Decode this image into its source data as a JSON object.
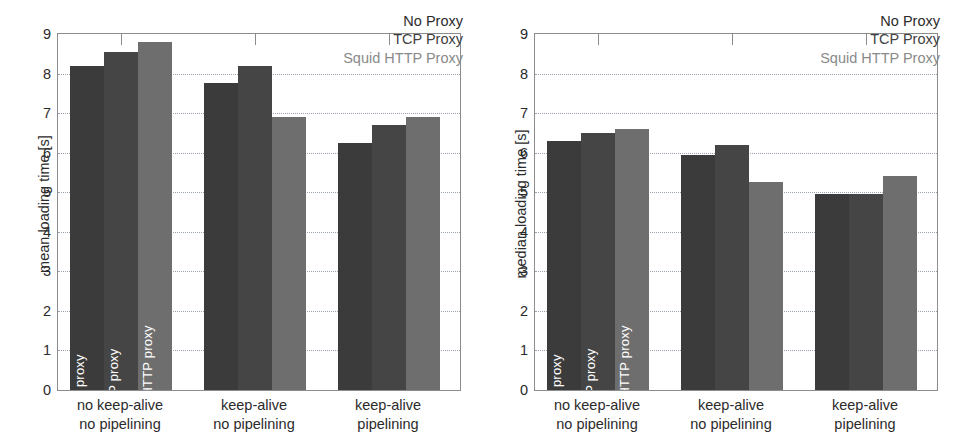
{
  "chart_data": [
    {
      "type": "bar",
      "title": "",
      "panel": "left",
      "xlabel": "",
      "ylabel": "mean loading time [s]",
      "ylim": [
        0,
        9
      ],
      "yticks": [
        0,
        1,
        2,
        3,
        4,
        5,
        6,
        7,
        8,
        9
      ],
      "ytick_labels": [
        "0",
        "1",
        "2",
        "3",
        "4",
        "5",
        "6",
        "7",
        "8",
        "9"
      ],
      "grid": true,
      "legend_position": "top-right",
      "categories": [
        "no keep-alive\nno pipelining",
        "keep-alive\nno pipelining",
        "keep-alive\npipelining"
      ],
      "category_lines": [
        [
          "no keep-alive",
          "no pipelining"
        ],
        [
          "keep-alive",
          "no pipelining"
        ],
        [
          "keep-alive",
          "pipelining"
        ]
      ],
      "series": [
        {
          "name": "No Proxy",
          "bar_label": "no proxy",
          "color": "#3b3b3b",
          "values": [
            8.2,
            7.75,
            6.25
          ]
        },
        {
          "name": "TCP Proxy",
          "bar_label": "TCP proxy",
          "color": "#454545",
          "values": [
            8.55,
            8.2,
            6.7
          ]
        },
        {
          "name": "Squid HTTP Proxy",
          "bar_label": "Squid HTTP proxy",
          "color": "#6e6e6e",
          "values": [
            8.8,
            6.9,
            6.9
          ]
        }
      ]
    },
    {
      "type": "bar",
      "title": "",
      "panel": "right",
      "xlabel": "",
      "ylabel": "median loading time [s]",
      "ylim": [
        0,
        9
      ],
      "yticks": [
        0,
        1,
        2,
        3,
        4,
        5,
        6,
        7,
        8,
        9
      ],
      "ytick_labels": [
        "0",
        "1",
        "2",
        "3",
        "4",
        "5",
        "6",
        "7",
        "8",
        "9"
      ],
      "grid": true,
      "legend_position": "top-right",
      "categories": [
        "no keep-alive\nno pipelining",
        "keep-alive\nno pipelining",
        "keep-alive\npipelining"
      ],
      "category_lines": [
        [
          "no keep-alive",
          "no pipelining"
        ],
        [
          "keep-alive",
          "no pipelining"
        ],
        [
          "keep-alive",
          "pipelining"
        ]
      ],
      "series": [
        {
          "name": "No Proxy",
          "bar_label": "no proxy",
          "color": "#3b3b3b",
          "values": [
            6.3,
            5.95,
            4.95
          ]
        },
        {
          "name": "TCP Proxy",
          "bar_label": "TCP proxy",
          "color": "#454545",
          "values": [
            6.5,
            6.2,
            4.95
          ]
        },
        {
          "name": "Squid HTTP Proxy",
          "bar_label": "Squid HTTP proxy",
          "color": "#6e6e6e",
          "values": [
            6.6,
            5.25,
            5.4
          ]
        }
      ]
    }
  ],
  "legend": {
    "entries": [
      {
        "label": "No Proxy",
        "color": "#2b2b2b"
      },
      {
        "label": "TCP Proxy",
        "color": "#3f3f3f"
      },
      {
        "label": "Squid HTTP Proxy",
        "color": "#8a8a8a"
      }
    ]
  },
  "style": {
    "axis_color": "#8c8c8c",
    "grid_color": "#9aa3b0",
    "background": "#ffffff",
    "bar_label_color": "#ffffff"
  }
}
